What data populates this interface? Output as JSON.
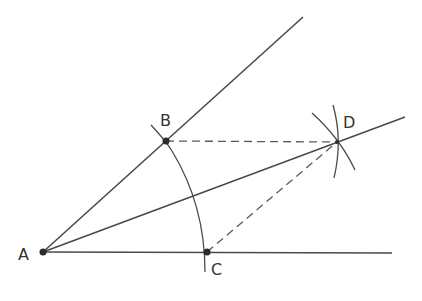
{
  "diagram": {
    "colors": {
      "line": "#4a4a4a",
      "point": "#2b2b2b",
      "label": "#333333"
    },
    "points": [
      {
        "id": "A",
        "label": "A",
        "x": 43,
        "y": 252
      },
      {
        "id": "B",
        "label": "B",
        "x": 166,
        "y": 141
      },
      {
        "id": "C",
        "label": "C",
        "x": 207,
        "y": 252
      },
      {
        "id": "D",
        "label": "D",
        "x": 337,
        "y": 142
      }
    ],
    "labels": {
      "A": "A",
      "B": "B",
      "C": "C",
      "D": "D"
    },
    "rays": [
      {
        "name": "upper-ray",
        "from": "A",
        "to": [
          303,
          17
        ],
        "style": "solid"
      },
      {
        "name": "lower-ray",
        "from": "A",
        "to": [
          392,
          253
        ],
        "style": "solid"
      },
      {
        "name": "bisector-ray",
        "from": "A",
        "to": [
          405,
          117
        ],
        "style": "solid"
      }
    ],
    "segments": [
      {
        "name": "BD",
        "from": "B",
        "to": "D",
        "style": "dashed"
      },
      {
        "name": "CD",
        "from": "C",
        "to": "D",
        "style": "dashed"
      }
    ],
    "arcs": [
      {
        "name": "arc-centered-A",
        "center": "A",
        "through": [
          "B",
          "C"
        ]
      },
      {
        "name": "arc-centered-B",
        "center": "B",
        "near": "D"
      },
      {
        "name": "arc-centered-C",
        "center": "C",
        "near": "D"
      }
    ]
  }
}
